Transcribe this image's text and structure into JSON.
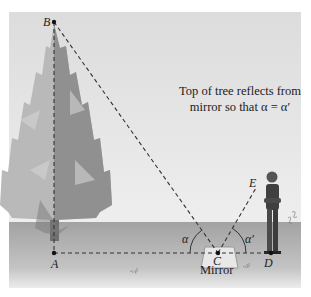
{
  "figure": {
    "caption_line1": "Top of tree reflects from",
    "caption_line2": "mirror so that α = α′",
    "mirror_label": "Mirror",
    "points": {
      "A": "A",
      "B": "B",
      "C": "C",
      "D": "D",
      "E": "E"
    },
    "angles": {
      "alpha": "α",
      "alpha_prime": "α′"
    },
    "handwritten_marks": [
      "5.5",
      "2.4",
      "2.1"
    ],
    "colors": {
      "sky": "#e6e6e6",
      "ground": "#a9a9a9",
      "tree_light": "#b8b8b8",
      "tree_dark": "#8a8a8a",
      "line": "#333333"
    }
  }
}
